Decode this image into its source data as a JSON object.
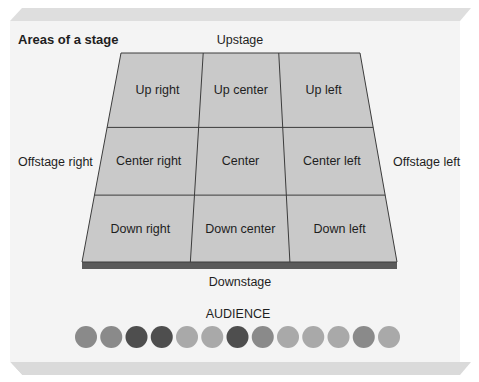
{
  "title": "Areas of a stage",
  "labels": {
    "upstage": "Upstage",
    "downstage": "Downstage",
    "offstage_right": "Offstage right",
    "offstage_left": "Offstage left",
    "audience": "AUDIENCE"
  },
  "grid": {
    "rows": 3,
    "cols": 3,
    "cells": [
      [
        "Up right",
        "Up center",
        "Up left"
      ],
      [
        "Center right",
        "Center",
        "Center left"
      ],
      [
        "Down right",
        "Down center",
        "Down left"
      ]
    ]
  },
  "colors": {
    "panel": "#f4f4f4",
    "panel_edge": "#dcdcdc",
    "stage_floor": "#c9c9c9",
    "stage_lines": "#3c3c3c",
    "stage_front": "#5a5a5a"
  },
  "audience": {
    "count": 13,
    "shades": [
      "#8a8a8a",
      "#8a8a8a",
      "#4e4e4e",
      "#4e4e4e",
      "#a9a9a9",
      "#a9a9a9",
      "#4e4e4e",
      "#8a8a8a",
      "#a9a9a9",
      "#a9a9a9",
      "#a9a9a9",
      "#8a8a8a",
      "#a9a9a9"
    ]
  }
}
